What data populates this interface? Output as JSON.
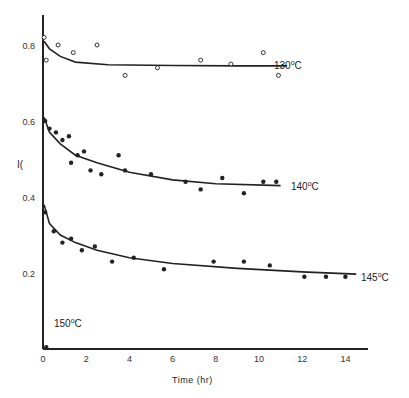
{
  "chart_data": {
    "type": "scatter",
    "title": "",
    "xlabel": "Time (hr)",
    "ylabel": "",
    "y_axis_stray_label": "I(",
    "xlim": [
      0,
      15
    ],
    "ylim": [
      0,
      0.9
    ],
    "x_ticks": [
      "0",
      "2",
      "4",
      "6",
      "8",
      "10",
      "12",
      "14"
    ],
    "y_ticks": [
      "0.2",
      "0.4",
      "0.6",
      "0.8"
    ],
    "grid": false,
    "series": [
      {
        "name": "130°C",
        "label_base": "130",
        "marker": "open",
        "points": [
          [
            0.05,
            0.82
          ],
          [
            0.15,
            0.76
          ],
          [
            0.7,
            0.8
          ],
          [
            1.4,
            0.78
          ],
          [
            2.5,
            0.8
          ],
          [
            3.8,
            0.72
          ],
          [
            5.3,
            0.74
          ],
          [
            7.3,
            0.76
          ],
          [
            8.7,
            0.75
          ],
          [
            10.2,
            0.78
          ],
          [
            10.9,
            0.72
          ]
        ],
        "curve": [
          [
            0.05,
            0.81
          ],
          [
            0.3,
            0.79
          ],
          [
            0.8,
            0.77
          ],
          [
            1.5,
            0.755
          ],
          [
            3,
            0.748
          ],
          [
            6,
            0.746
          ],
          [
            9,
            0.745
          ],
          [
            11.3,
            0.745
          ]
        ]
      },
      {
        "name": "140°C",
        "label_base": "140",
        "marker": "filled",
        "points": [
          [
            0.1,
            0.6
          ],
          [
            0.3,
            0.58
          ],
          [
            0.6,
            0.57
          ],
          [
            0.9,
            0.55
          ],
          [
            1.2,
            0.56
          ],
          [
            1.6,
            0.51
          ],
          [
            1.9,
            0.52
          ],
          [
            2.2,
            0.47
          ],
          [
            1.3,
            0.49
          ],
          [
            2.7,
            0.46
          ],
          [
            3.5,
            0.51
          ],
          [
            3.8,
            0.47
          ],
          [
            5,
            0.46
          ],
          [
            6.6,
            0.44
          ],
          [
            7.3,
            0.42
          ],
          [
            8.3,
            0.45
          ],
          [
            9.3,
            0.41
          ],
          [
            10.2,
            0.44
          ],
          [
            10.8,
            0.44
          ]
        ],
        "curve": [
          [
            0.05,
            0.61
          ],
          [
            0.3,
            0.57
          ],
          [
            0.8,
            0.54
          ],
          [
            1.5,
            0.51
          ],
          [
            2.5,
            0.49
          ],
          [
            4,
            0.465
          ],
          [
            6,
            0.445
          ],
          [
            8,
            0.435
          ],
          [
            11,
            0.43
          ]
        ]
      },
      {
        "name": "145°C",
        "label_base": "145",
        "marker": "filled",
        "points": [
          [
            0.1,
            0.36
          ],
          [
            0.5,
            0.31
          ],
          [
            0.9,
            0.28
          ],
          [
            1.3,
            0.29
          ],
          [
            1.8,
            0.26
          ],
          [
            2.4,
            0.27
          ],
          [
            3.2,
            0.23
          ],
          [
            4.2,
            0.24
          ],
          [
            5.6,
            0.21
          ],
          [
            7.9,
            0.23
          ],
          [
            9.3,
            0.23
          ],
          [
            10.5,
            0.22
          ],
          [
            12.1,
            0.19
          ],
          [
            13.1,
            0.19
          ],
          [
            14,
            0.19
          ]
        ],
        "curve": [
          [
            0.05,
            0.38
          ],
          [
            0.3,
            0.33
          ],
          [
            0.8,
            0.3
          ],
          [
            1.5,
            0.28
          ],
          [
            2.5,
            0.26
          ],
          [
            4,
            0.24
          ],
          [
            6,
            0.225
          ],
          [
            9,
            0.212
          ],
          [
            12,
            0.203
          ],
          [
            14.5,
            0.197
          ]
        ]
      },
      {
        "name": "150°C",
        "label_base": "150",
        "marker": "filled",
        "points": [
          [
            0.15,
            0.005
          ]
        ],
        "curve": []
      }
    ],
    "annotations": [
      {
        "text": "130°C",
        "x": 11.5,
        "y": 0.745
      },
      {
        "text": "140°C",
        "x": 11.5,
        "y": 0.43
      },
      {
        "text": "145°C",
        "x": 14.7,
        "y": 0.195
      },
      {
        "text": "150°C",
        "x": 0.4,
        "y": 0.06
      }
    ],
    "legend": "none (inline curve labels)"
  },
  "axes": {
    "xlabel": "Time (hr)",
    "stray_label": "I(",
    "degree_sup": "o",
    "unit": "C"
  },
  "labels": {
    "l130": "130",
    "l140": "140",
    "l145": "145",
    "l150": "150"
  }
}
